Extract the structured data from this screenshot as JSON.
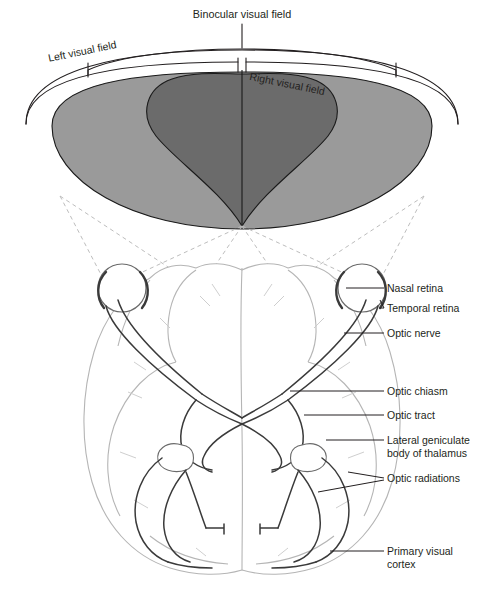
{
  "figure": {
    "top_diagram": {
      "binocular_label": "Binocular visual field",
      "left_field_label": "Left visual field",
      "right_field_label": "Right visual field",
      "colors": {
        "monocular_fill": "#9a9a9a",
        "binocular_fill": "#6b6b6b",
        "outline": "#1a1a1a",
        "projection_dash": "#b9b9b9"
      }
    },
    "brain_diagram": {
      "colors": {
        "brain_outline": "#b5b5b5",
        "pathway": "#3a3a3a",
        "leader_line": "#231f20"
      }
    },
    "labels": [
      {
        "id": "nasal-retina",
        "text": "Nasal retina",
        "text2": "",
        "y": 288
      },
      {
        "id": "temporal-retina",
        "text": "Temporal retina",
        "text2": "",
        "y": 308
      },
      {
        "id": "optic-nerve",
        "text": "Optic nerve",
        "text2": "",
        "y": 333
      },
      {
        "id": "optic-chiasm",
        "text": "Optic chiasm",
        "text2": "",
        "y": 391
      },
      {
        "id": "optic-tract",
        "text": "Optic tract",
        "text2": "",
        "y": 415
      },
      {
        "id": "lateral-geniculate",
        "text": "Lateral geniculate",
        "text2": "body of thalamus",
        "y": 440
      },
      {
        "id": "optic-radiations",
        "text": "Optic radiations",
        "text2": "",
        "y": 478
      },
      {
        "id": "primary-visual-cortex",
        "text": "Primary visual",
        "text2": "cortex",
        "y": 551
      }
    ]
  }
}
